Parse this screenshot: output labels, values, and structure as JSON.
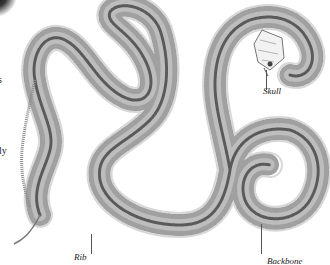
{
  "figure": {
    "labels": {
      "skull": "Skull",
      "rib": "Rib",
      "backbone": "Backbone"
    },
    "edge_text_fragments": [
      "s",
      "ly"
    ]
  },
  "colors": {
    "background": "#ffffff",
    "bone_dark": "#555555",
    "bone_light": "#9a9a9a",
    "label_text": "#222222"
  }
}
